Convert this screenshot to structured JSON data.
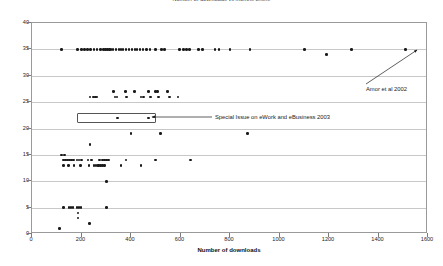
{
  "chart_data": {
    "type": "scatter",
    "title": "Number of downloads vs months online",
    "xlabel": "Number of downloads",
    "ylabel": "",
    "xlim": [
      0,
      1600
    ],
    "ylim": [
      0,
      40
    ],
    "xticks": [
      0,
      200,
      400,
      600,
      800,
      1000,
      1200,
      1400,
      1600
    ],
    "xtick_labels": [
      "0",
      "200",
      "400",
      "600",
      "800",
      "1000",
      "1200",
      "1400",
      "1600"
    ],
    "yticks": [
      0,
      5,
      10,
      15,
      20,
      25,
      30,
      35,
      40
    ],
    "ytick_labels": [
      "0",
      "5",
      "10",
      "15",
      "20",
      "25",
      "30",
      "35",
      "40"
    ],
    "grid": "horizontal",
    "legend": "none",
    "marker": "filled-circle",
    "marker_color": "#1a1a1a",
    "points": [
      [
        120,
        35
      ],
      [
        185,
        35
      ],
      [
        200,
        35
      ],
      [
        212,
        35
      ],
      [
        224,
        35
      ],
      [
        236,
        35
      ],
      [
        250,
        35
      ],
      [
        262,
        35
      ],
      [
        276,
        35
      ],
      [
        288,
        35
      ],
      [
        296,
        35
      ],
      [
        304,
        35
      ],
      [
        312,
        35
      ],
      [
        320,
        35
      ],
      [
        328,
        35
      ],
      [
        340,
        35
      ],
      [
        352,
        35
      ],
      [
        360,
        35
      ],
      [
        368,
        35
      ],
      [
        380,
        35
      ],
      [
        392,
        35
      ],
      [
        404,
        35
      ],
      [
        416,
        35
      ],
      [
        424,
        35
      ],
      [
        436,
        35
      ],
      [
        448,
        35
      ],
      [
        462,
        35
      ],
      [
        476,
        35
      ],
      [
        500,
        35
      ],
      [
        524,
        35
      ],
      [
        536,
        35
      ],
      [
        596,
        35
      ],
      [
        612,
        35
      ],
      [
        624,
        35
      ],
      [
        636,
        35
      ],
      [
        672,
        35
      ],
      [
        688,
        35
      ],
      [
        740,
        35
      ],
      [
        756,
        35
      ],
      [
        800,
        35
      ],
      [
        880,
        35
      ],
      [
        1100,
        35
      ],
      [
        1190,
        34
      ],
      [
        1290,
        35
      ],
      [
        1510,
        35
      ],
      [
        235,
        26
      ],
      [
        248,
        26
      ],
      [
        256,
        26
      ],
      [
        262,
        26
      ],
      [
        330,
        27
      ],
      [
        336,
        26
      ],
      [
        344,
        26
      ],
      [
        378,
        27
      ],
      [
        382,
        26
      ],
      [
        414,
        27
      ],
      [
        440,
        26
      ],
      [
        450,
        26
      ],
      [
        470,
        27
      ],
      [
        478,
        26
      ],
      [
        500,
        27
      ],
      [
        508,
        27
      ],
      [
        512,
        26
      ],
      [
        548,
        27
      ],
      [
        556,
        26
      ],
      [
        590,
        26
      ],
      [
        345,
        22
      ],
      [
        470,
        22
      ],
      [
        400,
        19
      ],
      [
        520,
        19
      ],
      [
        870,
        19
      ],
      [
        235,
        17
      ],
      [
        118,
        15
      ],
      [
        132,
        15
      ],
      [
        128,
        14
      ],
      [
        136,
        14
      ],
      [
        144,
        14
      ],
      [
        152,
        14
      ],
      [
        160,
        14
      ],
      [
        168,
        14
      ],
      [
        182,
        14
      ],
      [
        190,
        14
      ],
      [
        200,
        14
      ],
      [
        226,
        14
      ],
      [
        240,
        14
      ],
      [
        272,
        14
      ],
      [
        286,
        14
      ],
      [
        294,
        14
      ],
      [
        302,
        14
      ],
      [
        310,
        14
      ],
      [
        148,
        13
      ],
      [
        196,
        13
      ],
      [
        268,
        13
      ],
      [
        276,
        13
      ],
      [
        284,
        13
      ],
      [
        292,
        13
      ],
      [
        380,
        14
      ],
      [
        500,
        14
      ],
      [
        640,
        14
      ],
      [
        128,
        13
      ],
      [
        170,
        13
      ],
      [
        230,
        13
      ],
      [
        250,
        13
      ],
      [
        258,
        13
      ],
      [
        266,
        13
      ],
      [
        360,
        13
      ],
      [
        440,
        13
      ],
      [
        300,
        10
      ],
      [
        128,
        5
      ],
      [
        150,
        5
      ],
      [
        158,
        5
      ],
      [
        166,
        5
      ],
      [
        182,
        5
      ],
      [
        190,
        5
      ],
      [
        198,
        5
      ],
      [
        300,
        5
      ],
      [
        186,
        4
      ],
      [
        186,
        3
      ],
      [
        232,
        2
      ],
      [
        110,
        1
      ]
    ],
    "annotations": [
      {
        "id": "amor-annotation",
        "text": "Amor et al 2002",
        "target_point": [
          1510,
          35
        ],
        "label_x": 366,
        "label_y": 86,
        "arrow_from": [
          366,
          84
        ],
        "arrow_to": [
          417,
          50
        ]
      },
      {
        "id": "special-issue-annotation",
        "text": "Special Issue on eWork and eBusiness 2003",
        "label_x": 215,
        "label_y": 114,
        "arrow_from": [
          212,
          117
        ],
        "arrow_to": [
          152,
          117
        ]
      }
    ],
    "highlight_boxes": [
      {
        "id": "special-issue-highlight",
        "x_range": [
          180,
          500
        ],
        "y_range": [
          21,
          23
        ]
      }
    ]
  }
}
